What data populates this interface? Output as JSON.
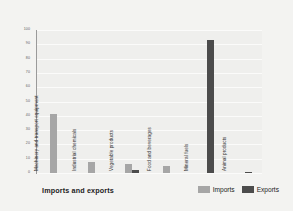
{
  "chart_data": {
    "type": "bar",
    "title": "",
    "xlabel": "Imports and exports",
    "ylabel": "Percentage of total",
    "ylim": [
      0,
      100
    ],
    "yticks": [
      0,
      10,
      20,
      30,
      40,
      50,
      60,
      70,
      80,
      90,
      100
    ],
    "grid": true,
    "legend_position": "bottom-right",
    "categories": [
      "Machinery and transport equipment",
      "Industrial chemicals",
      "Vegetable products",
      "Food and beverages",
      "Mineral fuels",
      "Animal products"
    ],
    "series": [
      {
        "name": "Imports",
        "color": "#a6a6a6",
        "values": [
          41,
          8,
          6,
          5,
          0,
          0
        ]
      },
      {
        "name": "Exports",
        "color": "#4c4c4c",
        "values": [
          0,
          0,
          2,
          0,
          93,
          1
        ]
      }
    ]
  },
  "axes": {
    "y_title": "Percentage of total",
    "x_title": "Imports and exports",
    "tick_labels": [
      "100",
      "90",
      "80",
      "70",
      "60",
      "50",
      "40",
      "30",
      "20",
      "10",
      "0"
    ]
  },
  "legend": {
    "items": [
      {
        "label": "Imports",
        "color": "#a6a6a6"
      },
      {
        "label": "Exports",
        "color": "#4c4c4c"
      }
    ]
  },
  "category_labels": [
    "Machinery and transport equipment",
    "Industrial chemicals",
    "Vegetable products",
    "Food and beverages",
    "Mineral fuels",
    "Animal products"
  ]
}
